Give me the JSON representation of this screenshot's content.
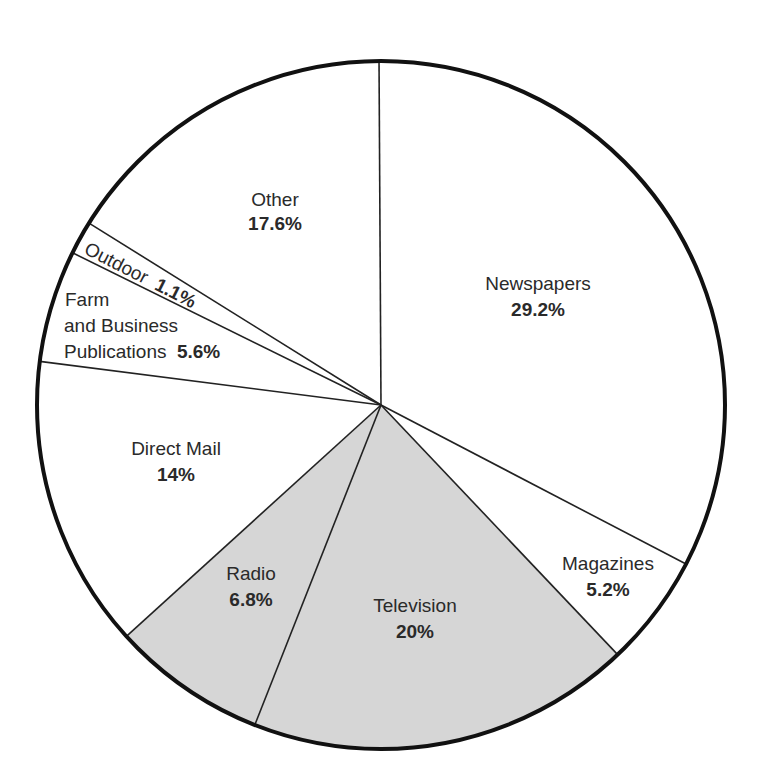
{
  "chart_data": {
    "type": "pie",
    "title": "",
    "start_angle_deg": 90,
    "direction": "clockwise",
    "slices": [
      {
        "label": "Newspapers",
        "value": 29.2,
        "pct_label": "29.2%",
        "fill": "#ffffff"
      },
      {
        "label": "Magazines",
        "value": 5.2,
        "pct_label": "5.2%",
        "fill": "#ffffff"
      },
      {
        "label": "Television",
        "value": 20,
        "pct_label": "20%",
        "fill": "#d6d6d6"
      },
      {
        "label": "Radio",
        "value": 6.8,
        "pct_label": "6.8%",
        "fill": "#d6d6d6"
      },
      {
        "label": "Direct Mail",
        "value": 14,
        "pct_label": "14%",
        "fill": "#ffffff"
      },
      {
        "label": "Farm and Business Publications",
        "value": 5.6,
        "pct_label": "5.6%",
        "fill": "#ffffff"
      },
      {
        "label": "Outdoor",
        "value": 1.1,
        "pct_label": "1.1%",
        "fill": "#ffffff"
      },
      {
        "label": "Other",
        "value": 17.6,
        "pct_label": "17.6%",
        "fill": "#ffffff"
      }
    ]
  },
  "geometry": {
    "cx": 381,
    "cy": 405,
    "r": 344,
    "boundary_points": [
      [
        379,
        57
      ],
      [
        684,
        563
      ],
      [
        618,
        655
      ],
      [
        254,
        727
      ],
      [
        130,
        633
      ],
      [
        45,
        362
      ],
      [
        77,
        255
      ],
      [
        92,
        225
      ]
    ]
  },
  "labels": {
    "newspapers": {
      "name": "Newspapers",
      "pct": "29.2%"
    },
    "magazines": {
      "name": "Magazines",
      "pct": "5.2%"
    },
    "television": {
      "name": "Television",
      "pct": "20%"
    },
    "radio": {
      "name": "Radio",
      "pct": "6.8%"
    },
    "direct_mail": {
      "name": "Direct Mail",
      "pct": "14%"
    },
    "farm": {
      "line1": "Farm",
      "line2": "and Business",
      "line3": "Publications",
      "pct": "5.6%"
    },
    "outdoor": {
      "name": "Outdoor",
      "pct": "1.1%"
    },
    "other": {
      "name": "Other",
      "pct": "17.6%"
    }
  },
  "colors": {
    "outline": "#111111",
    "divider": "#222222",
    "shaded": "#d6d6d6",
    "background": "#ffffff"
  }
}
